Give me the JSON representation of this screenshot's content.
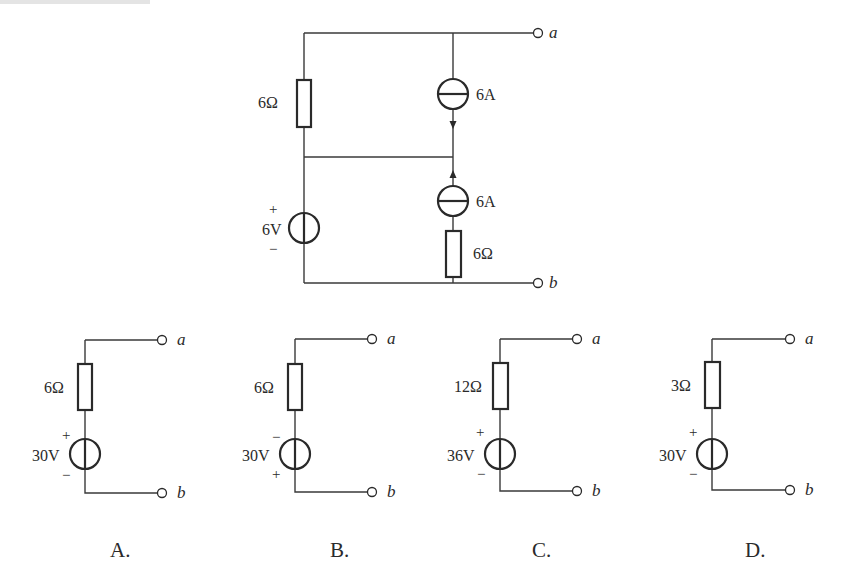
{
  "header": {
    "cropped_text": "…"
  },
  "main_circuit": {
    "resistor_left": {
      "label": "6Ω"
    },
    "voltage_source": {
      "label": "6V",
      "plus": "+",
      "minus": "−"
    },
    "current_source_top": {
      "label": "6A",
      "direction": "down"
    },
    "current_source_bottom": {
      "label": "6A",
      "direction": "up"
    },
    "resistor_right": {
      "label": "6Ω"
    },
    "terminal_a": "a",
    "terminal_b": "b"
  },
  "options": [
    {
      "letter": "A.",
      "resistor": "6Ω",
      "source": "30V",
      "top_sign": "+",
      "bottom_sign": "−",
      "terminal_a": "a",
      "terminal_b": "b"
    },
    {
      "letter": "B.",
      "resistor": "6Ω",
      "source": "30V",
      "top_sign": "−",
      "bottom_sign": "+",
      "terminal_a": "a",
      "terminal_b": "b"
    },
    {
      "letter": "C.",
      "resistor": "12Ω",
      "source": "36V",
      "top_sign": "+",
      "bottom_sign": "−",
      "terminal_a": "a",
      "terminal_b": "b"
    },
    {
      "letter": "D.",
      "resistor": "3Ω",
      "source": "30V",
      "top_sign": "+",
      "bottom_sign": "−",
      "terminal_a": "a",
      "terminal_b": "b"
    }
  ],
  "colors": {
    "line": "#2a2a2a",
    "background": "#ffffff"
  }
}
